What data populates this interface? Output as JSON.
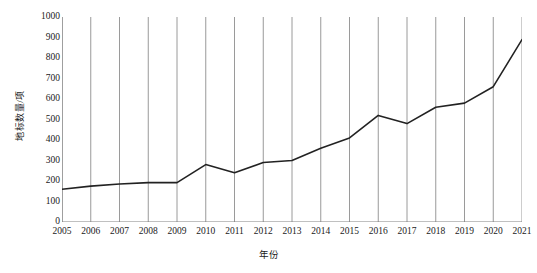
{
  "chart_data": {
    "type": "line",
    "title": "",
    "subtitle": "",
    "xlabel": "年份",
    "ylabel": "地标数量/项",
    "x": [
      2005,
      2006,
      2007,
      2008,
      2009,
      2010,
      2011,
      2012,
      2013,
      2014,
      2015,
      2016,
      2017,
      2018,
      2019,
      2020,
      2021
    ],
    "categories": [
      "2005",
      "2006",
      "2007",
      "2008",
      "2009",
      "2010",
      "2011",
      "2012",
      "2013",
      "2014",
      "2015",
      "2016",
      "2017",
      "2018",
      "2019",
      "2020",
      "2021"
    ],
    "values": [
      160,
      175,
      185,
      192,
      192,
      280,
      240,
      290,
      300,
      360,
      410,
      520,
      480,
      560,
      580,
      660,
      890
    ],
    "series": [
      {
        "name": "地标数量",
        "values": [
          160,
          175,
          185,
          192,
          192,
          280,
          240,
          290,
          300,
          360,
          410,
          520,
          480,
          560,
          580,
          660,
          890
        ]
      }
    ],
    "xlim": [
      2005,
      2021
    ],
    "ylim": [
      0,
      1000
    ],
    "yticks": [
      0,
      100,
      200,
      300,
      400,
      500,
      600,
      700,
      800,
      900,
      1000
    ],
    "ytick_labels": [
      "0",
      "100",
      "200",
      "300",
      "400",
      "500",
      "600",
      "700",
      "800",
      "900",
      "1000"
    ],
    "grid": "vertical",
    "legend": "none",
    "line_color": "#222222",
    "grid_color": "#808080",
    "axis_color": "#808080",
    "background_color": "#ffffff"
  }
}
